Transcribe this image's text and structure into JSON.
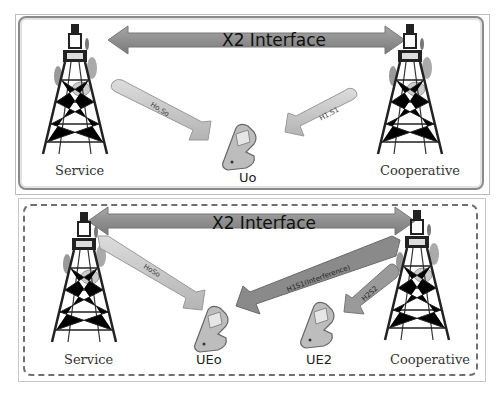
{
  "top_panel": {
    "interface_label": "X2 Interface",
    "left_tower_label": "Service",
    "right_tower_label": "Cooperative",
    "ue_label": "Uo",
    "arrow_left_label": "Ho,So",
    "arrow_right_label": "H1,S1"
  },
  "bottom_panel": {
    "interface_label": "X2 Interface",
    "left_tower_label": "Service",
    "right_tower_label": "Cooperative",
    "ue0_label": "UEo",
    "ue2_label": "UE2",
    "arrow_service_label": "HoSo",
    "arrow_interference_label": "H1S1(Interference)",
    "arrow_coop_label": "H2S2"
  },
  "colors": {
    "x2_arrow": "#8c8c8c",
    "signal_arrow": "#c8c8c8",
    "interference_arrow": "#8a8a8a",
    "border": "#8a8a8a"
  }
}
